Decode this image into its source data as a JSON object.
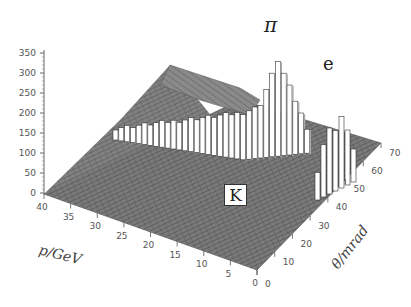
{
  "chart_data": {
    "type": "lego3d",
    "title": "",
    "zlabel": "",
    "xlabel": "p/GeV",
    "ylabel": "θ/mrad",
    "z_ticks": [
      0,
      50,
      100,
      150,
      200,
      250,
      300,
      350
    ],
    "x_ticks": [
      40,
      35,
      30,
      25,
      20,
      15,
      10,
      5,
      0
    ],
    "y_ticks": [
      0,
      10,
      20,
      30,
      40,
      50,
      60,
      70
    ],
    "zlim": [
      0,
      350
    ],
    "xlim": [
      0,
      40
    ],
    "ylim": [
      0,
      70
    ],
    "annotations": [
      {
        "label": "π",
        "description": "pion band, highest peak ~340 counts at low p, large θ"
      },
      {
        "label": "e",
        "description": "electron band, peak ~200 counts at θ≈50-55 mrad"
      },
      {
        "label": "K",
        "description": "kaon band, boxed label, low ridge"
      }
    ],
    "series": [
      {
        "name": "π",
        "peak_counts": 340,
        "theta_at_high_p_mrad": 30,
        "theta_at_low_p_mrad": 52
      },
      {
        "name": "e",
        "peak_counts": 200,
        "theta_mrad": 53
      },
      {
        "name": "K",
        "peak_counts": 20,
        "theta_at_low_p_mrad": 25
      },
      {
        "name": "background_plane",
        "counts_at_p40_theta70": 320,
        "counts_at_p0_theta0": 0
      }
    ],
    "grid": false,
    "legend": "none"
  },
  "labels": {
    "pi": "π",
    "e": "e",
    "k": "K",
    "x_axis_title": "p/GeV",
    "y_axis_title": "θ/mrad"
  }
}
